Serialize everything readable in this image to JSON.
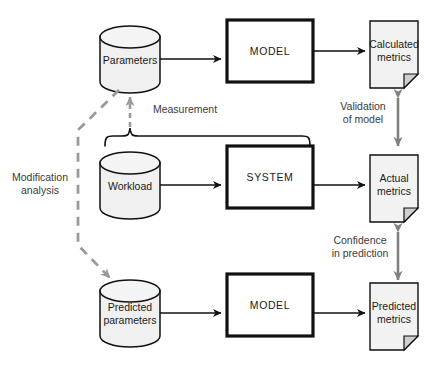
{
  "diagram": {
    "colors": {
      "cylinder_fill": "#f0f0f0",
      "document_fill": "#f2f2f2",
      "box_fill": "#ffffff",
      "stroke": "#111111",
      "dashed_arrow": "#9a9a9a",
      "double_arrow": "#808080",
      "text": "#1a1a1a"
    },
    "nodes": {
      "parameters": {
        "label": "Parameters",
        "shape": "cylinder"
      },
      "model_top": {
        "label": "MODEL",
        "shape": "box"
      },
      "calculated_metrics": {
        "label_line1": "Calculated",
        "label_line2": "metrics",
        "shape": "document"
      },
      "workload": {
        "label": "Workload",
        "shape": "cylinder"
      },
      "system": {
        "label": "SYSTEM",
        "shape": "box"
      },
      "actual_metrics": {
        "label_line1": "Actual",
        "label_line2": "metrics",
        "shape": "document"
      },
      "predicted_parameters": {
        "label_line1": "Predicted",
        "label_line2": "parameters",
        "shape": "cylinder"
      },
      "model_bottom": {
        "label": "MODEL",
        "shape": "box"
      },
      "predicted_metrics": {
        "label_line1": "Predicted",
        "label_line2": "metrics",
        "shape": "document"
      }
    },
    "annotations": {
      "measurement": "Measurement",
      "validation_line1": "Validation",
      "validation_line2": "of model",
      "confidence_line1": "Confidence",
      "confidence_line2": "in prediction",
      "modification_line1": "Modification",
      "modification_line2": "analysis"
    }
  }
}
